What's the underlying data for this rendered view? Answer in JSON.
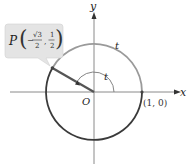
{
  "diagram": {
    "axes": {
      "x_label": "x",
      "y_label": "y",
      "origin_label": "O"
    },
    "point_label": {
      "prefix": "P",
      "x_num": "√3",
      "x_den": "2",
      "x_sign": "−",
      "y_num": "1",
      "y_den": "2"
    },
    "start_point_label": "(1, 0)",
    "arc_label": "t",
    "angle_label": "t",
    "colors": {
      "axis": "#888888",
      "circle_dark": "#444444",
      "circle_light": "#999999",
      "callout_bg": "#e6e6e6",
      "segment": "#555555"
    }
  }
}
